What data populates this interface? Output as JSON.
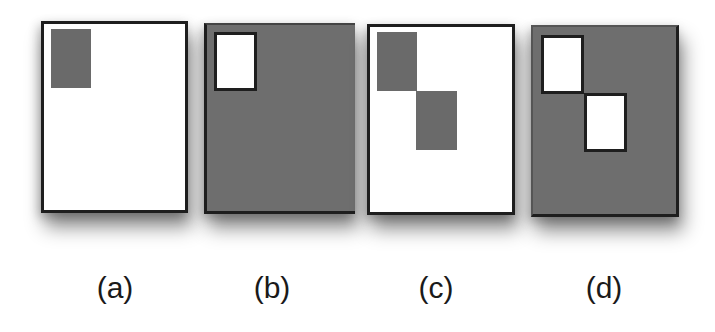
{
  "figure": {
    "colors": {
      "shaded": "#6e6e6e",
      "unshaded": "#ffffff",
      "border": "#1e1e1e"
    },
    "panels": [
      {
        "label": "(a)",
        "background": "white",
        "boxes": [
          {
            "fill": "gray",
            "bordered": false
          }
        ]
      },
      {
        "label": "(b)",
        "background": "gray",
        "boxes": [
          {
            "fill": "white",
            "bordered": true
          }
        ]
      },
      {
        "label": "(c)",
        "background": "white",
        "boxes": [
          {
            "fill": "gray",
            "bordered": false
          },
          {
            "fill": "gray",
            "bordered": false
          }
        ]
      },
      {
        "label": "(d)",
        "background": "gray",
        "boxes": [
          {
            "fill": "white",
            "bordered": true
          },
          {
            "fill": "white",
            "bordered": true
          }
        ]
      }
    ]
  }
}
